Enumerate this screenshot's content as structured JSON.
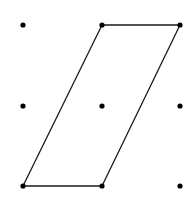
{
  "diagram": {
    "colors": {
      "background": "#ffffff",
      "stroke": "#1a1a1a",
      "dot": "#000000"
    },
    "grid": {
      "columns_x": [
        23,
        102,
        180
      ],
      "rows_y": [
        25,
        106,
        186
      ],
      "dot_radius": 2.6
    },
    "parallelogram": {
      "vertices": [
        {
          "col": 1,
          "row": 0
        },
        {
          "col": 2,
          "row": 0
        },
        {
          "col": 1,
          "row": 2
        },
        {
          "col": 0,
          "row": 2
        }
      ],
      "stroke_width": 1.3
    }
  }
}
